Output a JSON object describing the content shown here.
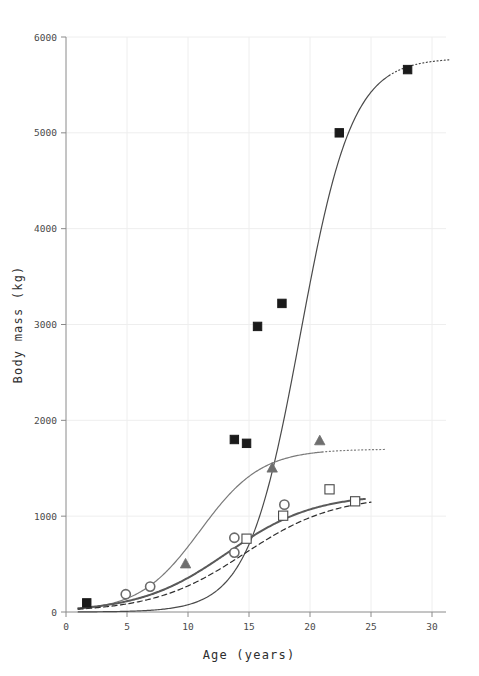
{
  "chart_data": {
    "type": "scatter",
    "title": "",
    "subtitle": "",
    "xlabel": "Age (years)",
    "ylabel": "Body mass (kg)",
    "xlim": [
      0,
      30
    ],
    "ylim": [
      0,
      6000
    ],
    "xticks": [
      0,
      5,
      10,
      15,
      20,
      25,
      30
    ],
    "yticks": [
      0,
      1000,
      2000,
      3000,
      4000,
      5000,
      6000
    ],
    "xtick_labels": [
      "0",
      "5",
      "10",
      "15",
      "20",
      "25",
      "30"
    ],
    "ytick_labels": [
      "0",
      "1000",
      "2000",
      "3000",
      "4000",
      "5000",
      "6000"
    ],
    "grid": "light horizontal and vertical gridlines at each tick",
    "legend": "none",
    "background": "#ffffff",
    "series": [
      {
        "name": "filled-squares",
        "marker": "filled-square",
        "color": "#1a1a1a",
        "points": [
          {
            "x": 1.7,
            "y": 95
          },
          {
            "x": 13.8,
            "y": 1800
          },
          {
            "x": 14.8,
            "y": 1760
          },
          {
            "x": 15.7,
            "y": 2980
          },
          {
            "x": 17.7,
            "y": 3220
          },
          {
            "x": 22.4,
            "y": 5000
          },
          {
            "x": 28.0,
            "y": 5660
          }
        ],
        "fit_curve": {
          "style": "solid",
          "color": "#4a4a4a",
          "asymptote": 5780,
          "inflection_x": 19.2,
          "growth_rate": 0.47,
          "solid_range": [
            1.0,
            26.5
          ],
          "dotted_extension_range": [
            26.5,
            31.5
          ]
        }
      },
      {
        "name": "filled-triangles",
        "marker": "filled-triangle",
        "color": "#6e6e6e",
        "points": [
          {
            "x": 9.8,
            "y": 500
          },
          {
            "x": 16.9,
            "y": 1500
          },
          {
            "x": 20.8,
            "y": 1785
          }
        ],
        "fit_curve": {
          "style": "solid",
          "color": "#7a7a7a",
          "asymptote": 1700,
          "inflection_x": 11.0,
          "growth_rate": 0.4,
          "solid_range": [
            1.0,
            21.0
          ],
          "dotted_extension_range": [
            21.0,
            26.2
          ]
        }
      },
      {
        "name": "open-circles",
        "marker": "open-circle",
        "color": "#6a6a6a",
        "points": [
          {
            "x": 4.9,
            "y": 185
          },
          {
            "x": 6.9,
            "y": 265
          },
          {
            "x": 13.8,
            "y": 775
          },
          {
            "x": 13.8,
            "y": 620
          },
          {
            "x": 17.9,
            "y": 1120
          }
        ],
        "fit_curve": {
          "style": "solid-thick",
          "color": "#5a5a5a",
          "asymptote": 1230,
          "inflection_x": 13.2,
          "growth_rate": 0.28,
          "solid_range": [
            1.0,
            24.5
          ],
          "dotted_extension_range": [
            6.0,
            13.0
          ]
        }
      },
      {
        "name": "open-squares",
        "marker": "open-square",
        "color": "#4a4a4a",
        "points": [
          {
            "x": 14.8,
            "y": 765
          },
          {
            "x": 17.8,
            "y": 1005
          },
          {
            "x": 21.6,
            "y": 1280
          },
          {
            "x": 23.7,
            "y": 1155
          }
        ],
        "fit_curve": {
          "style": "dashed",
          "color": "#2e2e2e",
          "asymptote": 1215,
          "inflection_x": 14.6,
          "growth_rate": 0.27,
          "solid_range": [
            1.0,
            25.0
          ]
        }
      }
    ]
  }
}
